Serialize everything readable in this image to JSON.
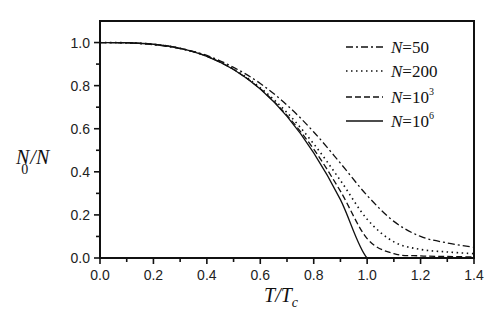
{
  "chart_data": {
    "type": "line",
    "title": "",
    "xlabel": "T/Tc",
    "ylabel": "N0/N",
    "xlim": [
      0.0,
      1.4
    ],
    "ylim": [
      0.0,
      1.1
    ],
    "x_ticks": [
      "0.0",
      "0.2",
      "0.4",
      "0.6",
      "0.8",
      "1.0",
      "1.2",
      "1.4"
    ],
    "y_ticks": [
      "0.0",
      "0.2",
      "0.4",
      "0.6",
      "0.8",
      "1.0"
    ],
    "grid": false,
    "legend_position": "upper right",
    "x": [
      0.0,
      0.1,
      0.2,
      0.3,
      0.4,
      0.5,
      0.6,
      0.7,
      0.8,
      0.9,
      1.0,
      1.1,
      1.2,
      1.3,
      1.4
    ],
    "series": [
      {
        "name": "N=50",
        "style": "dash-dot",
        "values": [
          1.0,
          0.998,
          0.99,
          0.972,
          0.94,
          0.885,
          0.81,
          0.71,
          0.585,
          0.44,
          0.29,
          0.17,
          0.1,
          0.07,
          0.05
        ]
      },
      {
        "name": "N=200",
        "style": "dotted",
        "values": [
          1.0,
          0.999,
          0.992,
          0.973,
          0.937,
          0.877,
          0.79,
          0.675,
          0.53,
          0.36,
          0.18,
          0.075,
          0.04,
          0.028,
          0.02
        ]
      },
      {
        "name": "N=10^3",
        "style": "dashed",
        "values": [
          1.0,
          0.999,
          0.992,
          0.973,
          0.936,
          0.875,
          0.785,
          0.662,
          0.505,
          0.31,
          0.09,
          0.02,
          0.01,
          0.007,
          0.005
        ]
      },
      {
        "name": "N=10^6",
        "style": "solid",
        "values": [
          1.0,
          0.999,
          0.992,
          0.973,
          0.936,
          0.875,
          0.784,
          0.657,
          0.488,
          0.271,
          0.0,
          0.0,
          0.0,
          0.0,
          0.0
        ]
      }
    ]
  },
  "legend": [
    {
      "prefix": "N",
      "text": "=50",
      "sup": ""
    },
    {
      "prefix": "N",
      "text": "=200",
      "sup": ""
    },
    {
      "prefix": "N",
      "text": "=10",
      "sup": "3"
    },
    {
      "prefix": "N",
      "text": "=10",
      "sup": "6"
    }
  ],
  "axes": {
    "ylabel_main": "N",
    "ylabel_sub": "0",
    "ylabel_rest": "/N",
    "xlabel_main": "T",
    "xlabel_slash": "/T",
    "xlabel_sub": "c"
  }
}
